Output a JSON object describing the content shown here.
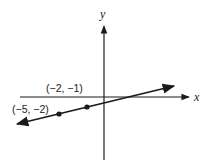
{
  "diagram": {
    "type": "coordinate-plane-line",
    "axes": {
      "x_label": "x",
      "y_label": "y"
    },
    "points": [
      {
        "label": "(−5, −2)",
        "x": -5,
        "y": -2
      },
      {
        "label": "(−2, −1)",
        "x": -2,
        "y": -1
      }
    ],
    "line": {
      "through": [
        "(−5, −2)",
        "(−2, −1)"
      ],
      "arrows": "both"
    },
    "colors": {
      "ink": "#1a1a1a",
      "background": "#ffffff"
    }
  }
}
